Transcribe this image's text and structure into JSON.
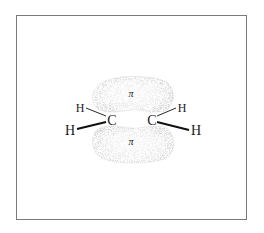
{
  "diagram": {
    "lobes": [
      {
        "label": "π",
        "position": "above"
      },
      {
        "label": "π",
        "position": "below"
      }
    ],
    "atoms": {
      "carbon_left": "C",
      "carbon_right": "C",
      "h_left_top": "H",
      "h_left_bottom": "H",
      "h_right_top": "H",
      "h_right_bottom": "H"
    },
    "colors": {
      "border": "#7a7a7a",
      "lobe_stipple": "#9a9a9a",
      "bond": "#1a1a1a"
    }
  }
}
